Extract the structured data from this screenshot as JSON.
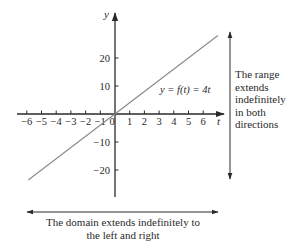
{
  "chart_data": {
    "type": "line",
    "title": "",
    "xlabel": "t",
    "ylabel": "y",
    "x_ticks": [
      -6,
      -5,
      -4,
      -3,
      -2,
      -1,
      0,
      1,
      2,
      3,
      4,
      5,
      6
    ],
    "x_tick_labels": [
      "−6",
      "−5",
      "−4",
      "−3",
      "−2",
      "−1",
      "0",
      "1",
      "2",
      "3",
      "4",
      "5",
      "6"
    ],
    "y_ticks": [
      20,
      10,
      -10,
      -20
    ],
    "y_tick_labels": [
      "20",
      "10",
      "−10",
      "−20"
    ],
    "xlim": [
      -6.2,
      7.4
    ],
    "ylim": [
      -29,
      36
    ],
    "grid": false,
    "legend": null,
    "series": [
      {
        "name": "y = f(t) = 4t",
        "x": [
          -5.9,
          7.0
        ],
        "y": [
          -23.6,
          28.0
        ],
        "color": "#8a8a8a"
      }
    ],
    "function_label": "y = f(t) = 4t",
    "annotations": [
      {
        "id": "range",
        "lines": [
          "The range",
          "extends",
          "indefinitely",
          "in both",
          "directions"
        ]
      },
      {
        "id": "domain",
        "lines": [
          "The domain extends indefinitely to",
          "the left and right"
        ]
      }
    ]
  },
  "colors": {
    "axis": "#2a2a2a",
    "line": "#8a8a8a",
    "text": "#2a2a2a",
    "background": "#ffffff"
  }
}
